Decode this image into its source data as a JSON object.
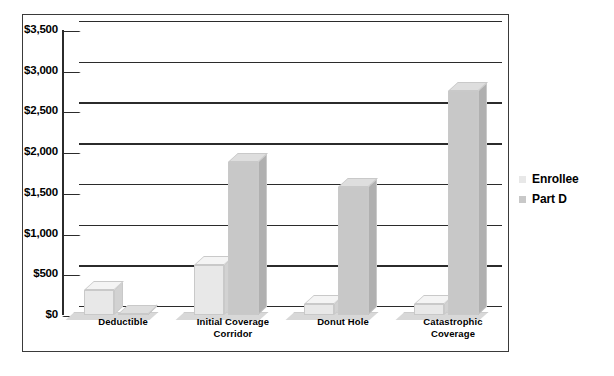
{
  "chart_data": {
    "type": "bar",
    "title": "",
    "subtitle": "",
    "xlabel": "",
    "ylabel": "",
    "categories": [
      "Deductible",
      "Initial Coverage Corridor",
      "Donut Hole",
      "Catastrophic Coverage"
    ],
    "category_lines": [
      [
        "Deductible"
      ],
      [
        "Initial Coverage",
        "Corridor"
      ],
      [
        "Donut Hole"
      ],
      [
        "Catastrophic",
        "Coverage"
      ]
    ],
    "series": [
      {
        "name": "Enrollee",
        "color": "#e8e8e8",
        "values": [
          310,
          620,
          130,
          130
        ]
      },
      {
        "name": "Part D",
        "color": "#c8c8c8",
        "values": [
          0,
          1880,
          1570,
          2750
        ]
      }
    ],
    "ylim": [
      0,
      3500
    ],
    "ytick_values": [
      0,
      500,
      1000,
      1500,
      2000,
      2500,
      3000,
      3500
    ],
    "ytick_labels": [
      "$0",
      "$500",
      "$1,000",
      "$1,500",
      "$2,000",
      "$2,500",
      "$3,000",
      "$3,500"
    ],
    "grid": true,
    "legend_position": "right",
    "three_d": true
  },
  "legend": {
    "entries": [
      {
        "label": "Enrollee",
        "color": "#e8e8e8"
      },
      {
        "label": "Part D",
        "color": "#c8c8c8"
      }
    ]
  },
  "colors": {
    "frame": "#3a3a3a",
    "axis": "#2b2b2b",
    "background": "#ffffff",
    "enrollee": "#e8e8e8",
    "part_d": "#c8c8c8"
  }
}
